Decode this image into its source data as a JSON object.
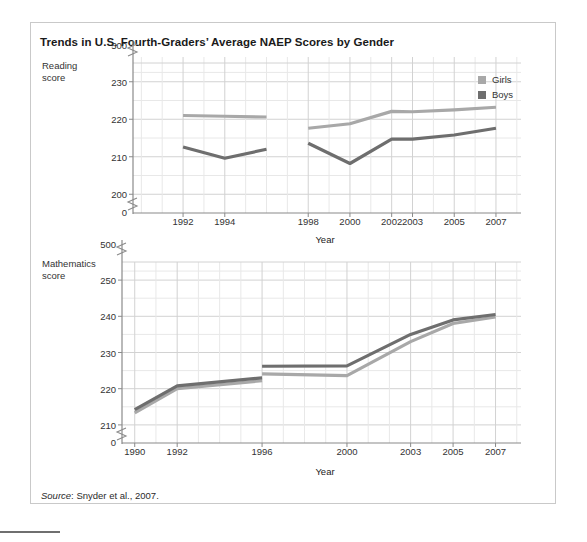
{
  "figure": {
    "title": "Trends in U.S. Fourth-Graders’ Average NAEP Scores by Gender",
    "source_word": "Source",
    "source_rest": ": Snyder et al., 2007."
  },
  "colors": {
    "girls": "#a8a8a8",
    "boys": "#6e6e6e",
    "axis": "#8a8a8a",
    "grid_major": "#d2d2d2",
    "grid_minor": "#e8e8e8",
    "frame": "#c9c9c9",
    "text": "#333333"
  },
  "legend": {
    "items": [
      {
        "label": "Girls",
        "color": "#a8a8a8"
      },
      {
        "label": "Boys",
        "color": "#6e6e6e"
      }
    ]
  },
  "chart_data": [
    {
      "type": "line",
      "panel": "top",
      "title": "",
      "ylabel": "Reading score",
      "ylabel_line1": "Reading",
      "ylabel_line2": "score",
      "xlabel": "Year",
      "axis_break_top": true,
      "axis_break_bottom": true,
      "ytick_labels": [
        "500",
        "230",
        "220",
        "210",
        "200",
        "0"
      ],
      "ytick_values": [
        500,
        230,
        220,
        210,
        200,
        0
      ],
      "ylim": [
        195,
        235
      ],
      "grid": true,
      "minor_gridlines_y": [
        205,
        215,
        225,
        232.5
      ],
      "legend_position": "top-right-inside",
      "x": [
        1990,
        1992,
        1994,
        1996,
        1998,
        2000,
        2002,
        2003,
        2005,
        2007
      ],
      "xtick_labels": [
        "1992",
        "1994",
        "1998",
        "2000",
        "2002",
        "2003",
        "2005",
        "2007"
      ],
      "xtick_values": [
        1992,
        1994,
        1998,
        2000,
        2002,
        2003,
        2005,
        2007
      ],
      "xlim": [
        1989.6,
        2008.2
      ],
      "series": [
        {
          "name": "Girls",
          "color": "#a8a8a8",
          "segments": [
            {
              "x": [
                1992,
                1994,
                1996
              ],
              "values": [
                221.0,
                220.8,
                220.6
              ]
            },
            {
              "x": [
                1998,
                2000,
                2002,
                2003,
                2005,
                2007
              ],
              "values": [
                217.6,
                218.8,
                222.1,
                222.0,
                222.5,
                223.2
              ]
            }
          ]
        },
        {
          "name": "Boys",
          "color": "#6e6e6e",
          "segments": [
            {
              "x": [
                1992,
                1994,
                1996
              ],
              "values": [
                212.6,
                209.6,
                212.0
              ]
            },
            {
              "x": [
                1998,
                2000,
                2002,
                2003,
                2005,
                2007
              ],
              "values": [
                213.6,
                208.2,
                214.7,
                214.7,
                215.8,
                217.6
              ]
            }
          ]
        }
      ]
    },
    {
      "type": "line",
      "panel": "bottom",
      "title": "",
      "ylabel": "Mathematics score",
      "ylabel_line1": "Mathematics",
      "ylabel_line2": "score",
      "xlabel": "Year",
      "axis_break_top": true,
      "axis_break_bottom": true,
      "ytick_labels": [
        "500",
        "250",
        "240",
        "230",
        "220",
        "210",
        "0"
      ],
      "ytick_values": [
        500,
        250,
        240,
        230,
        220,
        210,
        0
      ],
      "ylim": [
        205,
        255
      ],
      "grid": true,
      "minor_gridlines_y": [
        215,
        225,
        235,
        245,
        252.5
      ],
      "x": [
        1990,
        1992,
        1996,
        2000,
        2003,
        2005,
        2007
      ],
      "xtick_labels": [
        "1990",
        "1992",
        "1996",
        "2000",
        "2003",
        "2005",
        "2007"
      ],
      "xtick_values": [
        1990,
        1992,
        1996,
        2000,
        2003,
        2005,
        2007
      ],
      "xlim": [
        1989.4,
        2008.2
      ],
      "series": [
        {
          "name": "Girls",
          "color": "#a8a8a8",
          "segments": [
            {
              "x": [
                1990,
                1992,
                1996
              ],
              "values": [
                213.3,
                220.0,
                222.2
              ]
            },
            {
              "x": [
                1996,
                2000,
                2003,
                2005,
                2007
              ],
              "values": [
                224.1,
                223.6,
                233.0,
                238.0,
                239.8
              ]
            }
          ]
        },
        {
          "name": "Boys",
          "color": "#6e6e6e",
          "segments": [
            {
              "x": [
                1990,
                1992,
                1996
              ],
              "values": [
                214.2,
                220.8,
                223.0
              ]
            },
            {
              "x": [
                1996,
                2000,
                2003,
                2005,
                2007
              ],
              "values": [
                226.2,
                226.3,
                235.0,
                239.0,
                240.5
              ]
            }
          ]
        }
      ]
    }
  ]
}
